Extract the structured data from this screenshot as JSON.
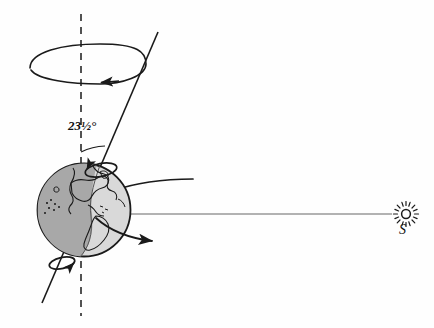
{
  "diagram": {
    "labels": {
      "tilt_angle": "23½°",
      "sun": "S"
    },
    "icons": {
      "sun": "sun-icon",
      "earth": "earth-globe-icon",
      "north_pole_rotation": "rotation-arrow-icon",
      "south_pole_rotation": "rotation-arrow-icon",
      "precession": "precession-arrow-icon"
    },
    "colors": {
      "stroke": "#1a1a1a",
      "earth_dark": "#a8a8a8",
      "earth_light": "#d8d8d8",
      "background": "#fefefe",
      "ray": "#555555"
    },
    "geometry": {
      "earth_center": [
        84,
        210
      ],
      "earth_radius": 47,
      "vertical_axis_x": 81,
      "tilt_degrees": 23.5,
      "sun_position": [
        406,
        214
      ]
    },
    "elements": [
      {
        "name": "vertical-reference-axis",
        "style": "dashed"
      },
      {
        "name": "tilted-rotation-axis",
        "style": "solid"
      },
      {
        "name": "precession-circle",
        "style": "solid ellipse with arrowhead"
      },
      {
        "name": "tilt-angle-arc",
        "style": "solid arc"
      },
      {
        "name": "sunlight-ray",
        "style": "thin horizontal line"
      },
      {
        "name": "tropic-arc",
        "style": "curved line"
      },
      {
        "name": "equator-arc",
        "style": "curved line with arrowhead"
      },
      {
        "name": "terminator",
        "style": "day-night boundary"
      }
    ]
  }
}
